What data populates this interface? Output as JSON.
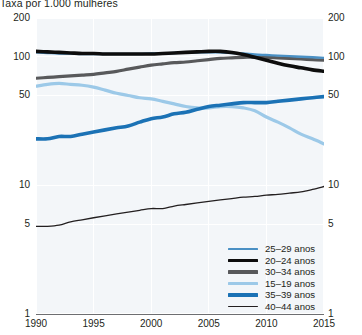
{
  "title": "Taxa por 1.000 mulheres",
  "axes": {
    "y_ticks_left": [
      "200",
      "100",
      "50",
      "10",
      "5",
      "1"
    ],
    "y_ticks_right": [
      "200",
      "100",
      "50",
      "10",
      "5",
      "1"
    ],
    "x_ticks": [
      "1990",
      "1995",
      "2000",
      "2005",
      "2010",
      "2015"
    ]
  },
  "legend": {
    "items": [
      {
        "label": "25–29 anos",
        "color": "#4a90c4",
        "width": 2.4
      },
      {
        "label": "20–24 anos",
        "color": "#0d0d0d",
        "width": 3.6
      },
      {
        "label": "30–34 anos",
        "color": "#58595b",
        "width": 3.2
      },
      {
        "label": "15–19 anos",
        "color": "#9cc9e8",
        "width": 3.2
      },
      {
        "label": "35–39 anos",
        "color": "#1b72b5",
        "width": 3.6
      },
      {
        "label": "40–44 anos",
        "color": "#231f20",
        "width": 1.3
      }
    ]
  },
  "chart_data": {
    "type": "line",
    "title": "Taxa por 1.000 mulheres",
    "xlabel": "",
    "ylabel": "Taxa por 1.000 mulheres",
    "yscale": "log",
    "ylim": [
      1,
      200
    ],
    "xlim": [
      1990,
      2015
    ],
    "y_ticks": [
      1,
      5,
      10,
      50,
      100,
      200
    ],
    "x_ticks": [
      1990,
      1995,
      2000,
      2005,
      2010,
      2015
    ],
    "grid": true,
    "legend_position": "bottom-right",
    "x": [
      1990,
      1991,
      1992,
      1993,
      1994,
      1995,
      1996,
      1997,
      1998,
      1999,
      2000,
      2001,
      2002,
      2003,
      2004,
      2005,
      2006,
      2007,
      2008,
      2009,
      2010,
      2011,
      2012,
      2013,
      2014,
      2015
    ],
    "series": [
      {
        "name": "25–29 anos",
        "color": "#4a90c4",
        "width": 2.4,
        "values": [
          108,
          107,
          106,
          106,
          105,
          105,
          105,
          105,
          105,
          105,
          106,
          106,
          107,
          108,
          108,
          108,
          108,
          107,
          106,
          104,
          103,
          102,
          101,
          100,
          99,
          98
        ]
      },
      {
        "name": "20–24 anos",
        "color": "#0d0d0d",
        "width": 3.6,
        "values": [
          110,
          109,
          108,
          107,
          106,
          106,
          105,
          105,
          105,
          105,
          105,
          106,
          107,
          108,
          109,
          110,
          110,
          108,
          104,
          99,
          94,
          89,
          85,
          82,
          79,
          77
        ]
      },
      {
        "name": "30–34 anos",
        "color": "#58595b",
        "width": 3.2,
        "values": [
          68,
          69,
          70,
          71,
          72,
          73,
          75,
          77,
          80,
          83,
          86,
          88,
          90,
          91,
          93,
          95,
          97,
          98,
          99,
          99,
          99,
          98,
          97,
          96,
          95,
          94
        ]
      },
      {
        "name": "15–19 anos",
        "color": "#9cc9e8",
        "width": 3.2,
        "values": [
          59,
          61,
          62,
          61,
          60,
          58,
          55,
          52,
          50,
          48,
          47,
          45,
          43,
          41,
          40,
          40,
          41,
          41,
          40,
          38,
          34,
          31,
          28,
          25,
          23,
          21
        ]
      },
      {
        "name": "35–39 anos",
        "color": "#1b72b5",
        "width": 3.6,
        "values": [
          23,
          23,
          24,
          24,
          25,
          26,
          27,
          28,
          29,
          31,
          33,
          34,
          36,
          37,
          39,
          41,
          42,
          43,
          44,
          44,
          44,
          45,
          46,
          47,
          48,
          49
        ]
      },
      {
        "name": "40–44 anos",
        "color": "#231f20",
        "width": 1.3,
        "values": [
          4.8,
          4.8,
          4.9,
          5.2,
          5.4,
          5.6,
          5.8,
          6.0,
          6.2,
          6.4,
          6.6,
          6.6,
          6.9,
          7.1,
          7.3,
          7.5,
          7.7,
          7.9,
          8.1,
          8.2,
          8.4,
          8.5,
          8.7,
          8.9,
          9.3,
          9.8
        ]
      }
    ]
  }
}
